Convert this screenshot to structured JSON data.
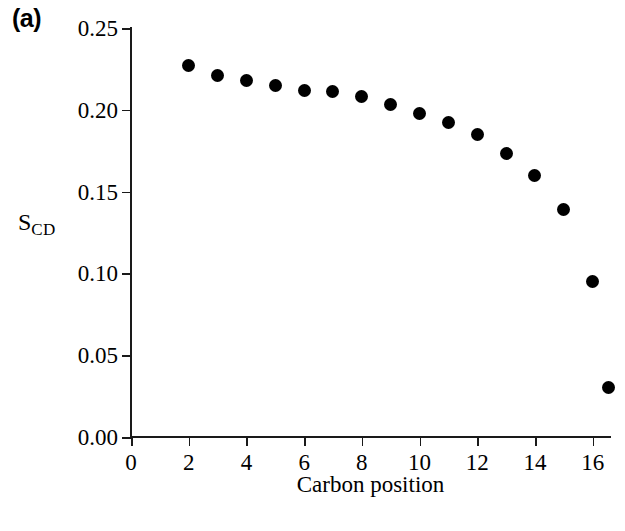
{
  "panel": {
    "label": "(a)"
  },
  "chart_data": {
    "type": "scatter",
    "title": "",
    "panel_label": "(a)",
    "xlabel": "Carbon position",
    "ylabel": "S_CD",
    "ylabel_base": "S",
    "ylabel_sub": "CD",
    "xlim": [
      0,
      16.6
    ],
    "ylim": [
      0.0,
      0.25
    ],
    "xticks": [
      0,
      2,
      4,
      6,
      8,
      10,
      12,
      14,
      16
    ],
    "xticklabels": [
      "0",
      "2",
      "4",
      "6",
      "8",
      "10",
      "12",
      "14",
      "16"
    ],
    "yticks": [
      0.0,
      0.05,
      0.1,
      0.15,
      0.2,
      0.25
    ],
    "yticklabels": [
      "0.00",
      "0.05",
      "0.10",
      "0.15",
      "0.20",
      "0.25"
    ],
    "grid": false,
    "legend": null,
    "marker": "filled-circle",
    "marker_color": "#000000",
    "marker_size_px": 13,
    "x": [
      2,
      3,
      4,
      5,
      6,
      7,
      8,
      9,
      10,
      11,
      12,
      13,
      14,
      15,
      16
    ],
    "y": [
      0.227,
      0.221,
      0.218,
      0.215,
      0.212,
      0.211,
      0.208,
      0.203,
      0.198,
      0.192,
      0.185,
      0.173,
      0.16,
      0.139,
      0.095,
      0.03
    ],
    "series": [
      {
        "name": "S_CD order parameter",
        "points": [
          {
            "x": 2,
            "y": 0.227
          },
          {
            "x": 3,
            "y": 0.221
          },
          {
            "x": 4,
            "y": 0.218
          },
          {
            "x": 5,
            "y": 0.215
          },
          {
            "x": 6,
            "y": 0.212
          },
          {
            "x": 7,
            "y": 0.211
          },
          {
            "x": 8,
            "y": 0.208
          },
          {
            "x": 9,
            "y": 0.203
          },
          {
            "x": 10,
            "y": 0.198
          },
          {
            "x": 11,
            "y": 0.192
          },
          {
            "x": 12,
            "y": 0.185
          },
          {
            "x": 13,
            "y": 0.173
          },
          {
            "x": 14,
            "y": 0.16
          },
          {
            "x": 15,
            "y": 0.139
          },
          {
            "x": 16,
            "y": 0.095
          },
          {
            "x": 16.55,
            "y": 0.03
          }
        ]
      }
    ]
  }
}
